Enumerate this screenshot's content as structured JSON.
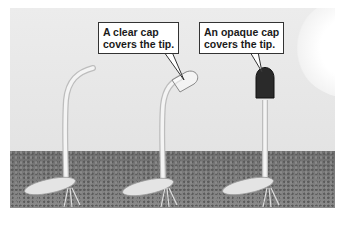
{
  "diagram": {
    "seedlings": [
      {
        "id": "control",
        "cap": "none",
        "bent_toward_light": true
      },
      {
        "id": "clear-cap",
        "cap": "clear",
        "bent_toward_light": true
      },
      {
        "id": "opaque-cap",
        "cap": "opaque",
        "bent_toward_light": false
      }
    ],
    "callouts": {
      "clear": "A clear cap\ncovers the tip.",
      "opaque": "An opaque cap\ncovers the tip."
    },
    "light_source": "sun",
    "colors": {
      "background": "#e6e6e6",
      "soil": "#7a7a7a",
      "opaque_cap": "#2a2a2a",
      "stem": "#e8e8e8"
    }
  }
}
